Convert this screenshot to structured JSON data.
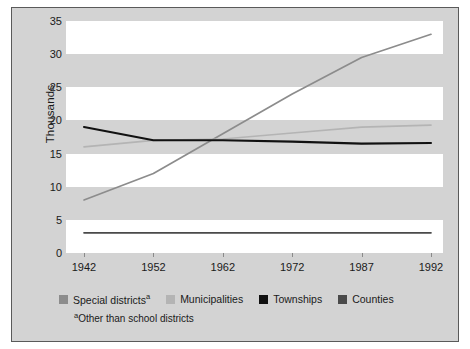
{
  "chart_data": {
    "type": "line",
    "title": "",
    "xlabel": "",
    "ylabel": "Thousands",
    "x": [
      "1942",
      "1952",
      "1962",
      "1972",
      "1987",
      "1992"
    ],
    "ylim": [
      0,
      35
    ],
    "yticks": [
      "0",
      "5",
      "10",
      "15",
      "20",
      "25",
      "30",
      "35"
    ],
    "grid": "alternating horizontal bands",
    "legend_position": "below-axis",
    "series": [
      {
        "name": "Special districts",
        "name_suffix": "a",
        "color": "#8c8c8c",
        "values": [
          8,
          12,
          18,
          24,
          29.5,
          33
        ]
      },
      {
        "name": "Municipalities",
        "name_suffix": "",
        "color": "#b4b4b4",
        "values": [
          16,
          17,
          17.2,
          18.1,
          19,
          19.3
        ]
      },
      {
        "name": "Townships",
        "name_suffix": "",
        "color": "#111111",
        "values": [
          19,
          17,
          17,
          16.8,
          16.5,
          16.6
        ]
      },
      {
        "name": "Counties",
        "name_suffix": "",
        "color": "#4a4a4a",
        "values": [
          3.05,
          3.05,
          3.05,
          3.05,
          3.05,
          3.05
        ]
      }
    ],
    "footnote_marker": "a",
    "footnote_text": "Other than school districts"
  },
  "colors": {
    "panel_background": "#d3d3d3",
    "panel_border": "#5a5a5a",
    "band": "#ffffff",
    "text": "#1a1a1a"
  }
}
